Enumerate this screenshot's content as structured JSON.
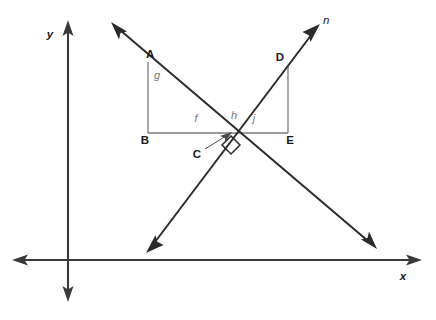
{
  "figure": {
    "background_color": "#ffffff"
  },
  "axes": {
    "x_label": "x",
    "y_label": "y",
    "origin_x": 68,
    "origin_y": 260,
    "color": "#3a3a3a"
  },
  "lines": {
    "line_n": {
      "label": "n",
      "description": "ray rising to upper right through intersection C",
      "color": "#2b2b2b"
    },
    "line_falling": {
      "label": "",
      "description": "line descending from upper left to lower right through intersection C",
      "color": "#2b2b2b"
    }
  },
  "points": {
    "A": "A",
    "B": "B",
    "C": "C",
    "D": "D",
    "E": "E"
  },
  "segments": {
    "g": "g",
    "f": "f",
    "h": "h",
    "j": "j"
  },
  "marks": {
    "right_angle": "right-angle-symbol"
  }
}
